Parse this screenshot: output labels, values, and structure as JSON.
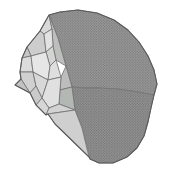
{
  "figure": {
    "canvas": {
      "width": 173,
      "height": 178,
      "background": "#ffffff"
    },
    "colors": {
      "edge": "#6e6e6e",
      "outline": "#5a5a5a",
      "dome_upper_base": "#9c9c9c",
      "dome_upper_dot": "#6f6f6f",
      "dome_lower_base": "#969696",
      "dome_lower_dot": "#6a6a6a"
    },
    "faces": [
      {
        "name": "dome-upper-facet",
        "pattern": "dome-upper",
        "points": [
          [
            49,
            15
          ],
          [
            60,
            12
          ],
          [
            78,
            10
          ],
          [
            97,
            13
          ],
          [
            114,
            20
          ],
          [
            128,
            30
          ],
          [
            139,
            42
          ],
          [
            148,
            56
          ],
          [
            154,
            70
          ],
          [
            157,
            84
          ],
          [
            154,
            95
          ],
          [
            138,
            92
          ],
          [
            118,
            89
          ],
          [
            98,
            88
          ],
          [
            84,
            88
          ],
          [
            72,
            87
          ],
          [
            66,
            66
          ],
          [
            58,
            38
          ]
        ]
      },
      {
        "name": "dome-lower-facet",
        "pattern": "dome-lower",
        "points": [
          [
            72,
            87
          ],
          [
            84,
            88
          ],
          [
            98,
            88
          ],
          [
            118,
            89
          ],
          [
            138,
            92
          ],
          [
            154,
            95
          ],
          [
            151,
            108
          ],
          [
            148,
            122
          ],
          [
            144,
            136
          ],
          [
            137,
            148
          ],
          [
            127,
            157
          ],
          [
            113,
            163
          ],
          [
            99,
            163
          ],
          [
            90,
            159
          ],
          [
            82,
            128
          ],
          [
            75,
            110
          ]
        ]
      },
      {
        "name": "apex-facet",
        "fill": "#d9d9d9",
        "points": [
          [
            49,
            15
          ],
          [
            40,
            31
          ],
          [
            44,
            34
          ],
          [
            52,
            29
          ]
        ]
      },
      {
        "name": "rim-facet-upper",
        "fill": "#bcbfbc",
        "points": [
          [
            49,
            15
          ],
          [
            52,
            29
          ],
          [
            53,
            46
          ],
          [
            56,
            60
          ],
          [
            66,
            66
          ],
          [
            58,
            38
          ]
        ]
      },
      {
        "name": "facet-1",
        "fill": "#cdcdcd",
        "points": [
          [
            40,
            31
          ],
          [
            27,
            47
          ],
          [
            31,
            56
          ],
          [
            46,
            52
          ],
          [
            44,
            34
          ]
        ]
      },
      {
        "name": "facet-2",
        "fill": "#e2e2e2",
        "points": [
          [
            44,
            34
          ],
          [
            46,
            52
          ],
          [
            53,
            46
          ],
          [
            52,
            29
          ]
        ]
      },
      {
        "name": "facet-3",
        "fill": "#d4d4d4",
        "points": [
          [
            46,
            52
          ],
          [
            50,
            66
          ],
          [
            56,
            60
          ],
          [
            53,
            46
          ]
        ]
      },
      {
        "name": "facet-4",
        "fill": "#c6c6c6",
        "points": [
          [
            27,
            47
          ],
          [
            22,
            58
          ],
          [
            31,
            56
          ]
        ]
      },
      {
        "name": "facet-5",
        "fill": "#dcdcdc",
        "points": [
          [
            22,
            58
          ],
          [
            20,
            72
          ],
          [
            33,
            72
          ],
          [
            31,
            56
          ]
        ]
      },
      {
        "name": "facet-6",
        "fill": "#e6e6e6",
        "points": [
          [
            31,
            56
          ],
          [
            33,
            72
          ],
          [
            48,
            80
          ],
          [
            50,
            66
          ],
          [
            46,
            52
          ]
        ]
      },
      {
        "name": "facet-7",
        "fill": "#d0d0d0",
        "points": [
          [
            20,
            72
          ],
          [
            21,
            79
          ],
          [
            30,
            93
          ],
          [
            36,
            86
          ],
          [
            33,
            72
          ]
        ]
      },
      {
        "name": "spike-facet",
        "fill": "#c2c2c2",
        "points": [
          [
            21,
            79
          ],
          [
            15,
            85
          ],
          [
            30,
            93
          ]
        ]
      },
      {
        "name": "facet-8",
        "fill": "#d8d8d8",
        "points": [
          [
            33,
            72
          ],
          [
            48,
            80
          ],
          [
            42,
            98
          ],
          [
            36,
            86
          ]
        ]
      },
      {
        "name": "facet-9",
        "fill": "#dedede",
        "points": [
          [
            56,
            60
          ],
          [
            61,
            77
          ],
          [
            48,
            80
          ],
          [
            50,
            66
          ]
        ]
      },
      {
        "name": "rim-facet-mid",
        "fill": "#bdbdbd",
        "points": [
          [
            66,
            66
          ],
          [
            72,
            87
          ],
          [
            60,
            90
          ],
          [
            61,
            77
          ]
        ]
      },
      {
        "name": "rim-facet-lower",
        "fill": "#b4b8b4",
        "points": [
          [
            72,
            87
          ],
          [
            75,
            110
          ],
          [
            59,
            104
          ],
          [
            60,
            90
          ]
        ]
      },
      {
        "name": "facet-10",
        "fill": "#e0e0e0",
        "points": [
          [
            48,
            80
          ],
          [
            61,
            77
          ],
          [
            60,
            90
          ],
          [
            59,
            104
          ],
          [
            49,
            108
          ],
          [
            42,
            98
          ]
        ]
      },
      {
        "name": "facet-11",
        "fill": "#cacaca",
        "points": [
          [
            30,
            93
          ],
          [
            36,
            105
          ],
          [
            42,
            98
          ],
          [
            36,
            86
          ]
        ]
      },
      {
        "name": "facet-12",
        "fill": "#d6d6d6",
        "points": [
          [
            36,
            105
          ],
          [
            46,
            115
          ],
          [
            49,
            108
          ],
          [
            42,
            98
          ]
        ]
      },
      {
        "name": "facet-13",
        "fill": "#d2d2d2",
        "points": [
          [
            46,
            115
          ],
          [
            49,
            108
          ],
          [
            59,
            104
          ],
          [
            75,
            110
          ],
          [
            48,
            114
          ]
        ]
      },
      {
        "name": "sliver-facet",
        "fill": "#cfcfcf",
        "points": [
          [
            48,
            114
          ],
          [
            75,
            110
          ],
          [
            82,
            128
          ],
          [
            89,
            157
          ],
          [
            55,
            124
          ]
        ]
      }
    ],
    "outline": [
      [
        49,
        15
      ],
      [
        60,
        12
      ],
      [
        78,
        10
      ],
      [
        97,
        13
      ],
      [
        114,
        20
      ],
      [
        128,
        30
      ],
      [
        139,
        42
      ],
      [
        148,
        56
      ],
      [
        154,
        70
      ],
      [
        157,
        84
      ],
      [
        154,
        95
      ],
      [
        151,
        108
      ],
      [
        148,
        122
      ],
      [
        144,
        136
      ],
      [
        137,
        148
      ],
      [
        127,
        157
      ],
      [
        113,
        163
      ],
      [
        99,
        163
      ],
      [
        90,
        159
      ],
      [
        89,
        157
      ],
      [
        55,
        124
      ],
      [
        48,
        114
      ],
      [
        46,
        115
      ],
      [
        36,
        105
      ],
      [
        30,
        93
      ],
      [
        15,
        85
      ],
      [
        21,
        79
      ],
      [
        20,
        72
      ],
      [
        22,
        58
      ],
      [
        27,
        47
      ],
      [
        40,
        31
      ]
    ]
  }
}
